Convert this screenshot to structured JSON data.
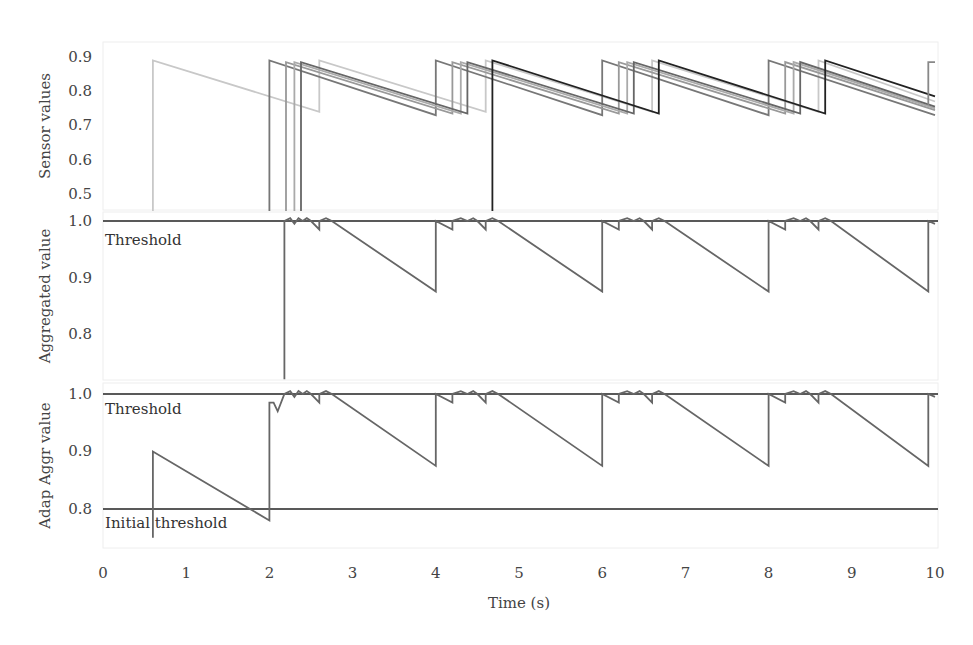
{
  "chart_data": [
    {
      "type": "line",
      "panel": "top",
      "ylabel": "Sensor values",
      "yticks": [
        "0.9",
        "0.8",
        "0.7",
        "0.6",
        "0.5"
      ],
      "ylim": [
        0.45,
        0.93
      ],
      "series": [
        {
          "name": "sensor-1",
          "color": "#c8c8c8",
          "points": [
            [
              0.6,
              0.45
            ],
            [
              0.6,
              0.89
            ],
            [
              2.6,
              0.74
            ],
            [
              2.6,
              0.89
            ],
            [
              4.6,
              0.74
            ],
            [
              4.6,
              0.89
            ],
            [
              6.6,
              0.74
            ],
            [
              6.6,
              0.89
            ],
            [
              8.6,
              0.74
            ],
            [
              8.6,
              0.89
            ],
            [
              10,
              0.77
            ]
          ]
        },
        {
          "name": "sensor-2",
          "color": "#777777",
          "points": [
            [
              2.0,
              0.45
            ],
            [
              2.0,
              0.89
            ],
            [
              4.0,
              0.73
            ],
            [
              4.0,
              0.89
            ],
            [
              6.0,
              0.73
            ],
            [
              6.0,
              0.89
            ],
            [
              8.0,
              0.73
            ],
            [
              8.0,
              0.89
            ],
            [
              10,
              0.73
            ]
          ]
        },
        {
          "name": "sensor-3",
          "color": "#999999",
          "points": [
            [
              2.2,
              0.45
            ],
            [
              2.2,
              0.885
            ],
            [
              4.2,
              0.735
            ],
            [
              4.2,
              0.885
            ],
            [
              6.2,
              0.735
            ],
            [
              6.2,
              0.885
            ],
            [
              8.2,
              0.735
            ],
            [
              8.2,
              0.885
            ],
            [
              10,
              0.745
            ]
          ]
        },
        {
          "name": "sensor-4",
          "color": "#aaaaaa",
          "points": [
            [
              2.3,
              0.45
            ],
            [
              2.3,
              0.885
            ],
            [
              4.3,
              0.735
            ],
            [
              4.3,
              0.885
            ],
            [
              6.3,
              0.735
            ],
            [
              6.3,
              0.885
            ],
            [
              8.3,
              0.735
            ],
            [
              8.3,
              0.885
            ],
            [
              10,
              0.75
            ]
          ]
        },
        {
          "name": "sensor-5",
          "color": "#666666",
          "points": [
            [
              2.38,
              0.45
            ],
            [
              2.38,
              0.885
            ],
            [
              4.38,
              0.735
            ],
            [
              4.38,
              0.885
            ],
            [
              6.38,
              0.735
            ],
            [
              6.38,
              0.885
            ],
            [
              8.38,
              0.735
            ],
            [
              8.38,
              0.885
            ],
            [
              10,
              0.755
            ]
          ]
        },
        {
          "name": "sensor-6",
          "color": "#222222",
          "points": [
            [
              4.68,
              0.45
            ],
            [
              4.68,
              0.89
            ],
            [
              6.68,
              0.735
            ],
            [
              6.68,
              0.89
            ],
            [
              8.68,
              0.735
            ],
            [
              8.68,
              0.89
            ],
            [
              10,
              0.785
            ]
          ]
        },
        {
          "name": "sensor-7",
          "color": "#888888",
          "points": [
            [
              9.92,
              0.76
            ],
            [
              9.92,
              0.885
            ],
            [
              10,
              0.885
            ]
          ]
        }
      ]
    },
    {
      "type": "line",
      "panel": "middle",
      "ylabel": "Aggregated value",
      "yticks": [
        "1.0",
        "0.9",
        "0.8"
      ],
      "ylim": [
        0.72,
        1.0
      ],
      "annotations": [
        {
          "text": "Threshold",
          "y": 1.0
        }
      ],
      "threshold": 1.0,
      "series": [
        {
          "name": "aggregated",
          "color": "#666666",
          "points": [
            [
              2.18,
              0.72
            ],
            [
              2.18,
              1.0
            ],
            [
              2.25,
              1.005
            ],
            [
              2.3,
              0.995
            ],
            [
              2.35,
              1.005
            ],
            [
              2.4,
              1.0
            ],
            [
              2.45,
              1.005
            ],
            [
              2.5,
              1.0
            ],
            [
              2.6,
              0.985
            ],
            [
              2.6,
              1.0
            ],
            [
              2.68,
              1.005
            ],
            [
              2.75,
              1.0
            ],
            [
              4.0,
              0.875
            ],
            [
              4.0,
              1.0
            ],
            [
              4.2,
              0.985
            ],
            [
              4.2,
              1.0
            ],
            [
              4.3,
              1.005
            ],
            [
              4.38,
              1.0
            ],
            [
              4.45,
              1.005
            ],
            [
              4.5,
              1.0
            ],
            [
              4.6,
              0.985
            ],
            [
              4.6,
              1.0
            ],
            [
              4.68,
              1.005
            ],
            [
              4.75,
              1.0
            ],
            [
              6.0,
              0.875
            ],
            [
              6.0,
              1.0
            ],
            [
              6.2,
              0.985
            ],
            [
              6.2,
              1.0
            ],
            [
              6.3,
              1.005
            ],
            [
              6.38,
              1.0
            ],
            [
              6.45,
              1.005
            ],
            [
              6.5,
              1.0
            ],
            [
              6.6,
              0.985
            ],
            [
              6.6,
              1.0
            ],
            [
              6.68,
              1.005
            ],
            [
              6.75,
              1.0
            ],
            [
              8.0,
              0.875
            ],
            [
              8.0,
              1.0
            ],
            [
              8.2,
              0.985
            ],
            [
              8.2,
              1.0
            ],
            [
              8.3,
              1.005
            ],
            [
              8.38,
              1.0
            ],
            [
              8.45,
              1.005
            ],
            [
              8.5,
              1.0
            ],
            [
              8.6,
              0.985
            ],
            [
              8.6,
              1.0
            ],
            [
              8.68,
              1.005
            ],
            [
              8.75,
              1.0
            ],
            [
              9.92,
              0.875
            ],
            [
              9.92,
              1.0
            ],
            [
              10,
              0.995
            ]
          ]
        }
      ]
    },
    {
      "type": "line",
      "panel": "bottom",
      "ylabel": "Adap Aggr value",
      "yticks": [
        "1.0",
        "0.9",
        "0.8"
      ],
      "ylim": [
        0.75,
        1.0
      ],
      "annotations": [
        {
          "text": "Threshold",
          "y": 1.0
        },
        {
          "text": "Initial threshold",
          "y": 0.8
        }
      ],
      "thresholds": [
        1.0,
        0.8
      ],
      "series": [
        {
          "name": "adaptive-aggregated",
          "color": "#666666",
          "points": [
            [
              0.6,
              0.75
            ],
            [
              0.6,
              0.9
            ],
            [
              2.0,
              0.78
            ],
            [
              2.0,
              0.985
            ],
            [
              2.05,
              0.985
            ],
            [
              2.1,
              0.97
            ],
            [
              2.18,
              1.0
            ],
            [
              2.25,
              1.005
            ],
            [
              2.3,
              0.995
            ],
            [
              2.35,
              1.005
            ],
            [
              2.4,
              1.0
            ],
            [
              2.45,
              1.005
            ],
            [
              2.5,
              1.0
            ],
            [
              2.6,
              0.985
            ],
            [
              2.6,
              1.0
            ],
            [
              2.68,
              1.005
            ],
            [
              2.75,
              1.0
            ],
            [
              4.0,
              0.875
            ],
            [
              4.0,
              1.0
            ],
            [
              4.2,
              0.985
            ],
            [
              4.2,
              1.0
            ],
            [
              4.3,
              1.005
            ],
            [
              4.38,
              1.0
            ],
            [
              4.45,
              1.005
            ],
            [
              4.5,
              1.0
            ],
            [
              4.6,
              0.985
            ],
            [
              4.6,
              1.0
            ],
            [
              4.68,
              1.005
            ],
            [
              4.75,
              1.0
            ],
            [
              6.0,
              0.875
            ],
            [
              6.0,
              1.0
            ],
            [
              6.2,
              0.985
            ],
            [
              6.2,
              1.0
            ],
            [
              6.3,
              1.005
            ],
            [
              6.38,
              1.0
            ],
            [
              6.45,
              1.005
            ],
            [
              6.5,
              1.0
            ],
            [
              6.6,
              0.985
            ],
            [
              6.6,
              1.0
            ],
            [
              6.68,
              1.005
            ],
            [
              6.75,
              1.0
            ],
            [
              8.0,
              0.875
            ],
            [
              8.0,
              1.0
            ],
            [
              8.2,
              0.985
            ],
            [
              8.2,
              1.0
            ],
            [
              8.3,
              1.005
            ],
            [
              8.38,
              1.0
            ],
            [
              8.45,
              1.005
            ],
            [
              8.5,
              1.0
            ],
            [
              8.6,
              0.985
            ],
            [
              8.6,
              1.0
            ],
            [
              8.68,
              1.005
            ],
            [
              8.75,
              1.0
            ],
            [
              9.92,
              0.875
            ],
            [
              9.92,
              1.0
            ],
            [
              10,
              0.995
            ]
          ]
        }
      ]
    }
  ],
  "xaxis": {
    "label": "Time (s)",
    "ticks": [
      "0",
      "1",
      "2",
      "3",
      "4",
      "5",
      "6",
      "7",
      "8",
      "9",
      "10"
    ],
    "xlim": [
      0,
      10
    ]
  },
  "labels": {
    "top_ylabel": "Sensor values",
    "mid_ylabel": "Aggregated value",
    "bot_ylabel": "Adap Aggr value",
    "threshold": "Threshold",
    "initial_threshold": "Initial threshold",
    "xlabel": "Time (s)"
  }
}
